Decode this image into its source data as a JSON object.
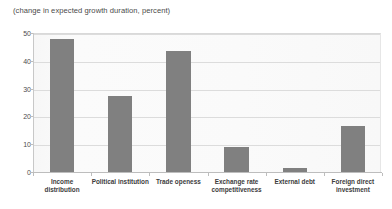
{
  "chart_data": {
    "type": "bar",
    "title": "(change in expected growth duration, percent)",
    "subtitle": "",
    "xlabel": "",
    "ylabel": "",
    "ylim": [
      0,
      50
    ],
    "yticks": [
      0,
      10,
      20,
      30,
      40,
      50
    ],
    "grid": true,
    "legend": "none",
    "bar_color": "#808080",
    "plot_background": "#fbfbfb",
    "gridline_color": "#dcdcdc",
    "categories": [
      "Income distribution",
      "Political institution",
      "Trade openess",
      "Exchange rate competitiveness",
      "External debt",
      "Foreign direct investment"
    ],
    "values": [
      48,
      27.5,
      43.5,
      9,
      1.5,
      16.5
    ]
  },
  "axis": {
    "y_tick_labels": [
      "0",
      "10",
      "20",
      "30",
      "40",
      "50"
    ]
  }
}
